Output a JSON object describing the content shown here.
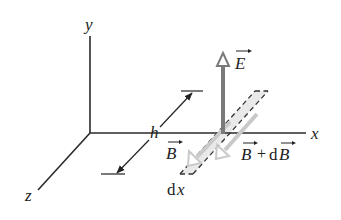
{
  "diagram": {
    "axes": {
      "x_label": "x",
      "y_label": "y",
      "z_label": "z"
    },
    "vectors": {
      "E_label": "E",
      "B_label": "B",
      "B_plus_dB_label_B1": "B",
      "B_plus_dB_plus": "+",
      "B_plus_dB_d": "d",
      "B_plus_dB_label_B2": "B"
    },
    "dimensions": {
      "height_label": "h",
      "width_label_d": "d",
      "width_label_x": "x"
    },
    "colors": {
      "axis": "#2a2a2a",
      "E_arrow": "#7a7a7a",
      "B_arrows": "#c8c8c8",
      "strip_fill": "#e6e6e6",
      "dash": "#333333"
    }
  }
}
